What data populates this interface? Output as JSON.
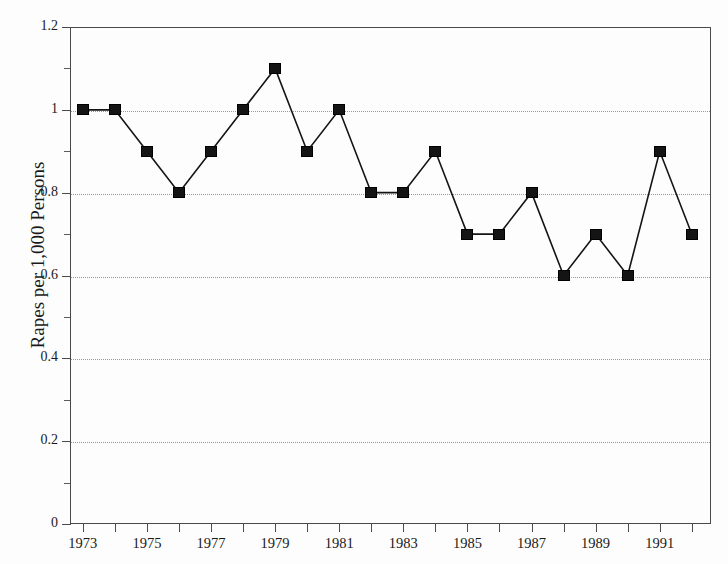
{
  "figure": {
    "title_remnant": "",
    "background_color": "#fdfdfd",
    "ink_color": "#141414",
    "grid_color": "#9a9a9a",
    "axis_color": "#4a4a4a"
  },
  "chart_data": {
    "type": "line",
    "title": "",
    "xlabel": "",
    "ylabel": "Rapes per 1,000 Persons",
    "xlim": [
      1972.6,
      1992.6
    ],
    "ylim": [
      0,
      1.2
    ],
    "grid": true,
    "grid_axis": "y",
    "legend": null,
    "marker": "square",
    "x": [
      1973,
      1974,
      1975,
      1976,
      1977,
      1978,
      1979,
      1980,
      1981,
      1982,
      1983,
      1984,
      1985,
      1986,
      1987,
      1988,
      1989,
      1990,
      1991,
      1992
    ],
    "values": [
      1.0,
      1.0,
      0.9,
      0.8,
      0.9,
      1.0,
      1.1,
      0.9,
      1.0,
      0.8,
      0.8,
      0.9,
      0.7,
      0.7,
      0.8,
      0.6,
      0.7,
      0.6,
      0.9,
      0.7
    ],
    "y_ticks": [
      0,
      0.2,
      0.4,
      0.6,
      0.8,
      1,
      1.2
    ],
    "y_tick_labels": [
      "0",
      "0.2",
      "0.4",
      "0.6",
      "0.8",
      "1",
      "1.2"
    ],
    "y_minor_ticks": [
      0.1,
      0.3,
      0.5,
      0.7,
      0.9,
      1.1
    ],
    "y_gridlines": [
      0.2,
      0.4,
      0.6,
      0.8,
      1
    ],
    "x_ticks": [
      1973,
      1974,
      1975,
      1976,
      1977,
      1978,
      1979,
      1980,
      1981,
      1982,
      1983,
      1984,
      1985,
      1986,
      1987,
      1988,
      1989,
      1990,
      1991,
      1992
    ],
    "x_tick_labels": [
      "1973",
      "",
      "1975",
      "",
      "1977",
      "",
      "1979",
      "",
      "1981",
      "",
      "1983",
      "",
      "1985",
      "",
      "1987",
      "",
      "1989",
      "",
      "1991",
      ""
    ]
  }
}
